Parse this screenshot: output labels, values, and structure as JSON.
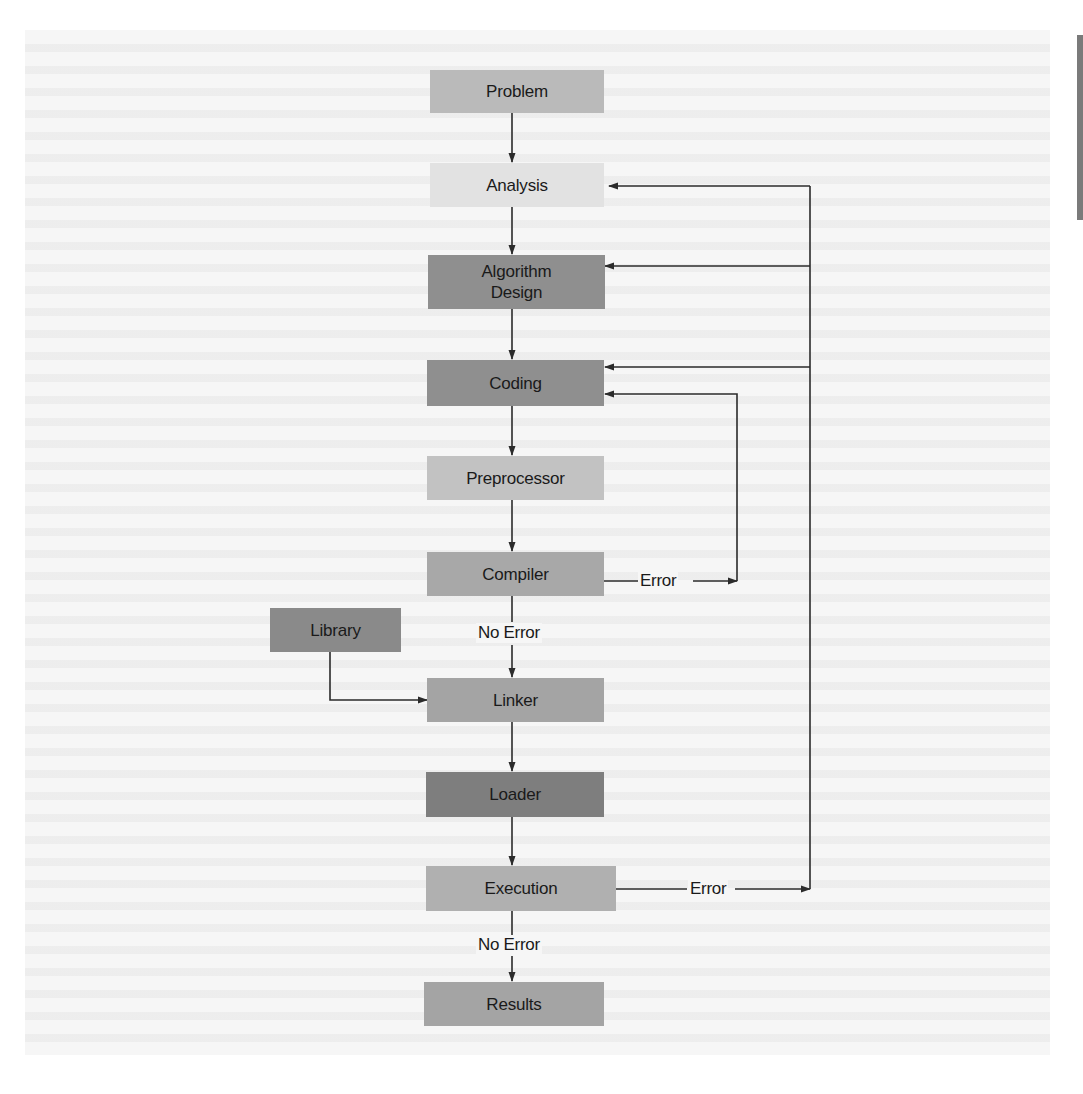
{
  "diagram": {
    "type": "flowchart",
    "nodes": [
      {
        "id": "problem",
        "label": "Problem",
        "fill": "#b9b9b9"
      },
      {
        "id": "analysis",
        "label": "Analysis",
        "fill": "#e4e4e4"
      },
      {
        "id": "algorithm_design",
        "label": "Algorithm\nDesign",
        "label_line1": "Algorithm",
        "label_line2": "Design",
        "fill": "#8f8f8f"
      },
      {
        "id": "coding",
        "label": "Coding",
        "fill": "#8f8f8f"
      },
      {
        "id": "preprocessor",
        "label": "Preprocessor",
        "fill": "#c2c2c2"
      },
      {
        "id": "compiler",
        "label": "Compiler",
        "fill": "#a9a9a9"
      },
      {
        "id": "library",
        "label": "Library",
        "fill": "#8a8a8a"
      },
      {
        "id": "linker",
        "label": "Linker",
        "fill": "#a4a4a4"
      },
      {
        "id": "loader",
        "label": "Loader",
        "fill": "#7e7e7e"
      },
      {
        "id": "execution",
        "label": "Execution",
        "fill": "#b0b0b0"
      },
      {
        "id": "results",
        "label": "Results",
        "fill": "#a4a4a4"
      }
    ],
    "edges": [
      {
        "from": "problem",
        "to": "analysis",
        "label": ""
      },
      {
        "from": "analysis",
        "to": "algorithm_design",
        "label": ""
      },
      {
        "from": "algorithm_design",
        "to": "coding",
        "label": ""
      },
      {
        "from": "coding",
        "to": "preprocessor",
        "label": ""
      },
      {
        "from": "preprocessor",
        "to": "compiler",
        "label": ""
      },
      {
        "from": "compiler",
        "to": "linker",
        "label": "No Error"
      },
      {
        "from": "compiler",
        "to": "coding",
        "label": "Error"
      },
      {
        "from": "library",
        "to": "linker",
        "label": ""
      },
      {
        "from": "linker",
        "to": "loader",
        "label": ""
      },
      {
        "from": "loader",
        "to": "execution",
        "label": ""
      },
      {
        "from": "execution",
        "to": "results",
        "label": "No Error"
      },
      {
        "from": "execution",
        "to": "analysis",
        "label": "Error"
      },
      {
        "from": "execution",
        "to": "algorithm_design",
        "label": "Error"
      },
      {
        "from": "execution",
        "to": "coding",
        "label": "Error"
      }
    ],
    "edge_labels": {
      "compiler_error": "Error",
      "compiler_no_error": "No Error",
      "execution_error": "Error",
      "execution_no_error": "No Error"
    },
    "colors": {
      "line": "#2b2b2b",
      "text": "#1a1a1a",
      "background": "#f6f6f6"
    }
  }
}
